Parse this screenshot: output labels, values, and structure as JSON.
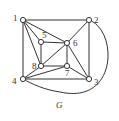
{
  "graph": {
    "caption": "G",
    "nodes": [
      "1",
      "2",
      "3",
      "4",
      "5",
      "6",
      "7",
      "8"
    ],
    "edges": [
      [
        "1",
        "2"
      ],
      [
        "1",
        "4"
      ],
      [
        "1",
        "5"
      ],
      [
        "1",
        "6"
      ],
      [
        "1",
        "8"
      ],
      [
        "2",
        "3"
      ],
      [
        "2",
        "6"
      ],
      [
        "2",
        "4"
      ],
      [
        "3",
        "4"
      ],
      [
        "3",
        "6"
      ],
      [
        "3",
        "7"
      ],
      [
        "4",
        "7"
      ],
      [
        "4",
        "8"
      ],
      [
        "5",
        "6"
      ],
      [
        "5",
        "8"
      ],
      [
        "6",
        "7"
      ],
      [
        "6",
        "8"
      ],
      [
        "7",
        "8"
      ]
    ],
    "curved_edges": [
      [
        "2",
        "4"
      ]
    ]
  }
}
